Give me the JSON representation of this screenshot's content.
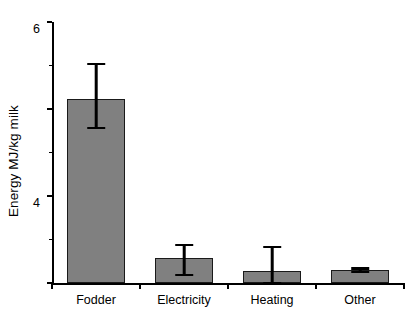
{
  "chart_data": {
    "type": "bar",
    "title": "",
    "xlabel": "",
    "ylabel": "Energy MJ/kg milk",
    "categories": [
      "Fodder",
      "Electricity",
      "Heating",
      "Other"
    ],
    "values": [
      4.23,
      0.57,
      0.28,
      0.3
    ],
    "errors_low": [
      3.56,
      0.18,
      0.0,
      0.25
    ],
    "errors_high": [
      5.03,
      0.87,
      0.83,
      0.34
    ],
    "ylim": [
      0,
      6
    ],
    "yticks": [
      0,
      2,
      4,
      6
    ],
    "ytick_labels": [
      "0",
      "2",
      "4",
      "6"
    ],
    "yticks_minor": [
      1,
      3,
      5
    ],
    "grid": false,
    "legend": null,
    "bar_color": "#808080",
    "bar_edge_color": "#1a1a1a",
    "error_color": "#000000",
    "axis_color": "#000000",
    "background_color": "#ffffff"
  }
}
